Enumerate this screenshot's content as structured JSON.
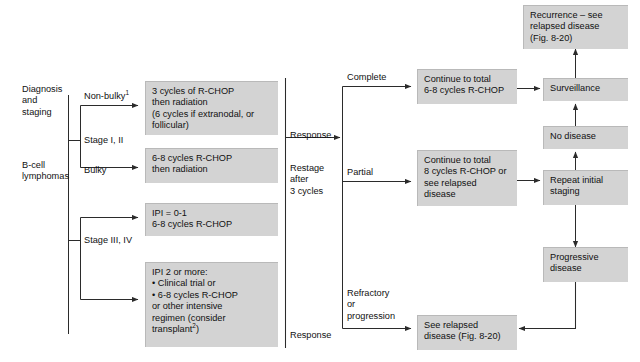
{
  "figure": {
    "colors": {
      "box_fill": "#d3d3d3",
      "box_edge": "#b9b9b9",
      "line": "#2b2b2b",
      "text": "#111111",
      "background": "#ffffff"
    }
  },
  "left_column": {
    "stage_label_1": "Diagnosis\nand\nstaging",
    "stage_label_2": "B-cell\nlymphomas",
    "branches": [
      {
        "name": "non-bulky",
        "label": "Non-bulky",
        "superscript": "1"
      },
      {
        "name": "stage-i-ii",
        "label": "Stage I, II",
        "superscript": ""
      },
      {
        "name": "bulky",
        "label": "Bulky",
        "superscript": ""
      },
      {
        "name": "stage-iii-iv",
        "label": "Stage III, IV",
        "superscript": ""
      }
    ],
    "treatment_boxes": [
      {
        "name": "non-bulky-treatment",
        "text": "3 cycles of R-CHOP\nthen radiation\n(6 cycles if extranodal, or\nfollicular)"
      },
      {
        "name": "bulky-treatment",
        "text": "6-8 cycles R-CHOP\nthen radiation"
      },
      {
        "name": "ipi-0-1-treatment",
        "text": "IPI = 0-1\n6-8 cycles R-CHOP"
      },
      {
        "name": "ipi-2-or-more-treatment",
        "text": "IPI 2 or more:\n    • Clinical trial or\n    • 6-8 cycles R-CHOP\nor other intensive\nregimen (consider\ntransplant",
        "text_superscript": "2",
        "text_tail": ")"
      }
    ]
  },
  "middle_column": {
    "response_label_top": "Response",
    "restage_label": "Restage\nafter\n3 cycles",
    "response_label_bottom": "Response",
    "branch_labels": [
      {
        "name": "complete-response",
        "label": "Complete"
      },
      {
        "name": "partial-response",
        "label": "Partial"
      },
      {
        "name": "refractory-or-progression",
        "label": "Refractory\nor\nprogression"
      }
    ],
    "outcome_boxes": [
      {
        "name": "complete-response-plan",
        "text": "Continue to total\n6-8 cycles R-CHOP"
      },
      {
        "name": "partial-response-plan",
        "text": "Continue to total\n8 cycles R-CHOP or\nsee relapsed\ndisease"
      },
      {
        "name": "refractory-plan",
        "text": "See relapsed\ndisease (Fig. 8-20)"
      }
    ]
  },
  "right_column": {
    "boxes": [
      {
        "name": "recurrence",
        "text": "Recurrence – see\nrelapsed disease\n(Fig. 8-20)"
      },
      {
        "name": "surveillance",
        "text": "Surveillance"
      },
      {
        "name": "no-disease",
        "text": "No disease"
      },
      {
        "name": "repeat-initial-staging",
        "text": "Repeat initial\nstaging"
      },
      {
        "name": "progressive-disease",
        "text": "Progressive\ndisease"
      }
    ]
  }
}
